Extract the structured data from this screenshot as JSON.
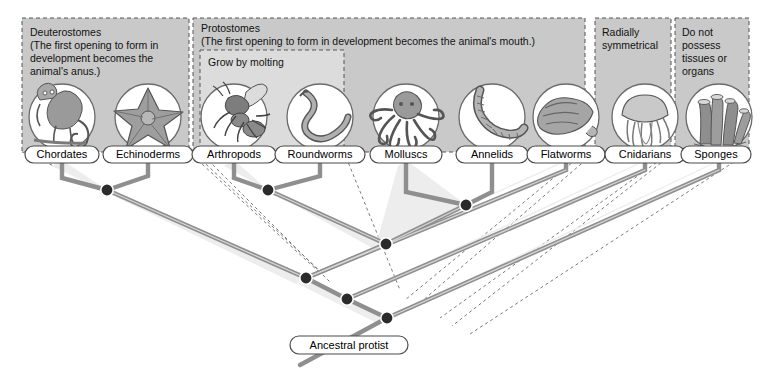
{
  "diagram": {
    "root_label": "Ancestral protist",
    "colors": {
      "group_fill": "#c9c9c9",
      "subgroup_fill": "#dcdcdc",
      "branch_stroke": "#8f8f8f",
      "branch_face": "#e6e6e6",
      "node_fill": "#2b2b2b",
      "label_fill": "#ffffff",
      "label_stroke": "#4a4a4a",
      "dash_stroke": "#6b6b6b"
    }
  },
  "groups": [
    {
      "id": "deuterostomes",
      "name": "Deuterostomes",
      "lines": [
        "Deuterostomes",
        "(The first opening to form in",
        "development becomes the",
        "animal's anus.)"
      ],
      "box": {
        "x": 22,
        "y": 18,
        "w": 167,
        "h": 134
      }
    },
    {
      "id": "protostomes",
      "name": "Protostomes",
      "lines": [
        "Protostomes",
        "(The first opening to form in development becomes the animal's mouth.)"
      ],
      "box": {
        "x": 193,
        "y": 18,
        "w": 392,
        "h": 134
      }
    },
    {
      "id": "grow-by-molting",
      "name": "Grow by molting",
      "lines": [
        "Grow by molting"
      ],
      "box": {
        "x": 200,
        "y": 50,
        "w": 144,
        "h": 102
      }
    },
    {
      "id": "radially-symmetrical",
      "name": "Radially symmetrical",
      "lines": [
        "Radially",
        "symmetrical"
      ],
      "box": {
        "x": 595,
        "y": 18,
        "w": 76,
        "h": 134
      }
    },
    {
      "id": "no-tissues-or-organs",
      "name": "Do not possess tissues or organs",
      "lines": [
        "Do not",
        "possess",
        "tissues or",
        "organs"
      ],
      "box": {
        "x": 675,
        "y": 18,
        "w": 74,
        "h": 134
      }
    }
  ],
  "taxa": [
    {
      "id": "chordates",
      "label": "Chordates",
      "icon": "monkey-icon",
      "cx": 62,
      "label_x": 62,
      "label_w": 74
    },
    {
      "id": "echinoderms",
      "label": "Echinoderms",
      "icon": "starfish-icon",
      "cx": 148,
      "label_x": 148,
      "label_w": 90
    },
    {
      "id": "arthropods",
      "label": "Arthropods",
      "icon": "ant-icon",
      "cx": 234,
      "label_x": 234,
      "label_w": 84
    },
    {
      "id": "roundworms",
      "label": "Roundworms",
      "icon": "roundworm-icon",
      "cx": 320,
      "label_x": 320,
      "label_w": 90
    },
    {
      "id": "molluscs",
      "label": "Molluscs",
      "icon": "octopus-icon",
      "cx": 406,
      "label_x": 406,
      "label_w": 72
    },
    {
      "id": "annelids",
      "label": "Annelids",
      "icon": "earthworm-icon",
      "cx": 492,
      "label_x": 492,
      "label_w": 72
    },
    {
      "id": "flatworms",
      "label": "Flatworms",
      "icon": "flatworm-icon",
      "cx": 566,
      "label_x": 566,
      "label_w": 78
    },
    {
      "id": "cnidarians",
      "label": "Cnidarians",
      "icon": "jellyfish-icon",
      "cx": 645,
      "label_x": 645,
      "label_w": 80
    },
    {
      "id": "sponges",
      "label": "Sponges",
      "icon": "sponge-icon",
      "cx": 719,
      "label_x": 716,
      "label_w": 70
    }
  ],
  "nodes": [
    {
      "id": "node-deuterostomes",
      "x": 107,
      "y": 190,
      "joins": [
        "chordates",
        "echinoderms"
      ]
    },
    {
      "id": "node-ecdysozoa",
      "x": 268,
      "y": 190,
      "joins": [
        "arthropods",
        "roundworms"
      ]
    },
    {
      "id": "node-lophotrochozoa",
      "x": 466,
      "y": 205,
      "joins": [
        "molluscs",
        "annelids"
      ]
    },
    {
      "id": "node-protostomes",
      "x": 386,
      "y": 244,
      "joins": [
        "node-ecdysozoa",
        "node-lophotrochozoa"
      ]
    },
    {
      "id": "node-bilateria",
      "x": 306,
      "y": 278,
      "joins": [
        "node-deuterostomes",
        "node-protostomes",
        "flatworms"
      ]
    },
    {
      "id": "node-eumetazoa",
      "x": 347,
      "y": 299,
      "joins": [
        "node-bilateria",
        "cnidarians"
      ]
    },
    {
      "id": "node-metazoa",
      "x": 387,
      "y": 318,
      "joins": [
        "node-eumetazoa",
        "sponges"
      ]
    }
  ],
  "root": {
    "label": "Ancestral protist",
    "x": 305,
    "y": 345,
    "w": 118
  }
}
